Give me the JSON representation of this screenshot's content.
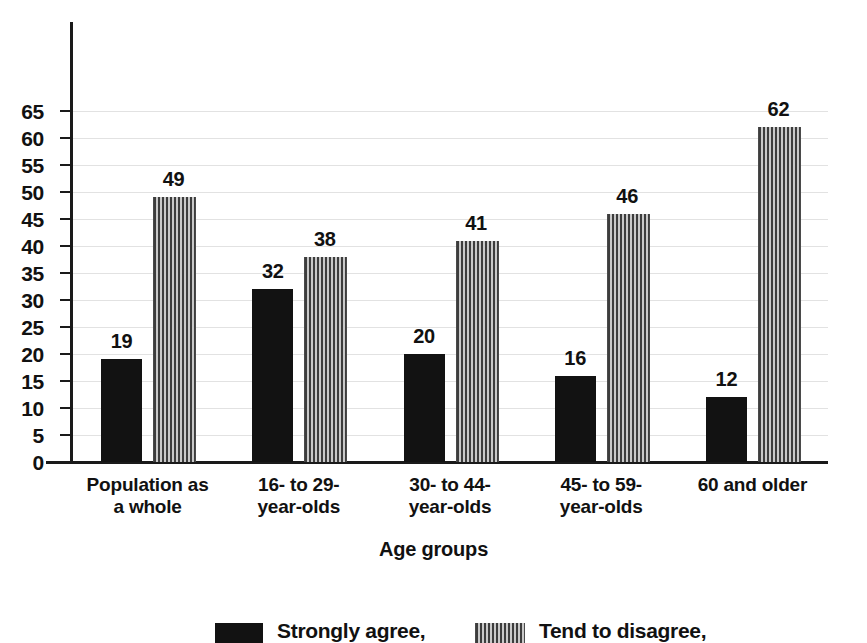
{
  "chart_data": {
    "type": "bar",
    "title": "",
    "xlabel": "Age groups",
    "ylabel": "",
    "ylim": [
      0,
      68
    ],
    "yticks": [
      0,
      5,
      10,
      15,
      20,
      25,
      30,
      35,
      40,
      45,
      50,
      55,
      60,
      65
    ],
    "ytick_labels": [
      "0",
      "5",
      "10",
      "15",
      "20",
      "25",
      "30",
      "35",
      "40",
      "45",
      "50",
      "55",
      "60",
      "65"
    ],
    "grid": true,
    "grid_axis": "y",
    "legend_position": "bottom",
    "categories": [
      "Population as\na whole",
      "16- to 29-\nyear-olds",
      "30- to 44-\nyear-olds",
      "45- to 59-\nyear-olds",
      "60 and older"
    ],
    "series": [
      {
        "name": "Strongly agree,",
        "pattern": "solid",
        "color": "#121212",
        "values": [
          19,
          32,
          20,
          16,
          12
        ]
      },
      {
        "name": "Tend to disagree,",
        "pattern": "vertical-stripes",
        "color": "#3d3d3d",
        "values": [
          49,
          38,
          41,
          46,
          62
        ]
      }
    ]
  },
  "legend": {
    "items": [
      {
        "label": "Strongly agree,",
        "pattern": "solid"
      },
      {
        "label": "Tend to disagree,",
        "pattern": "striped"
      }
    ]
  },
  "axis": {
    "x_title": "Age groups"
  }
}
